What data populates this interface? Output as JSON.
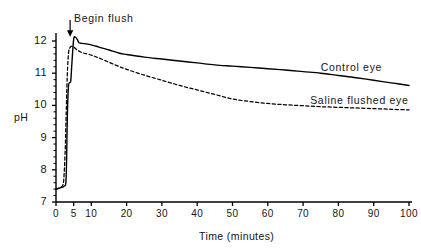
{
  "chart_data": {
    "type": "line",
    "title": "",
    "subtitle": "",
    "xlabel": "Time (minutes)",
    "ylabel": "pH",
    "xlim": [
      0,
      100
    ],
    "ylim": [
      7,
      12.3
    ],
    "grid": false,
    "legend_position": "inline-right",
    "xticks": [
      {
        "value": 0,
        "label": "0"
      },
      {
        "value": 5,
        "label": "5"
      },
      {
        "value": 10,
        "label": "10"
      },
      {
        "value": 20,
        "label": "20"
      },
      {
        "value": 30,
        "label": "30"
      },
      {
        "value": 40,
        "label": "40"
      },
      {
        "value": 50,
        "label": "50"
      },
      {
        "value": 60,
        "label": "60"
      },
      {
        "value": 70,
        "label": "70"
      },
      {
        "value": 80,
        "label": "80"
      },
      {
        "value": 90,
        "label": "90"
      },
      {
        "value": 100,
        "label": "100"
      }
    ],
    "yticks": [
      {
        "value": 7,
        "label": "7"
      },
      {
        "value": 8,
        "label": "8"
      },
      {
        "value": 9,
        "label": "9"
      },
      {
        "value": 10,
        "label": "10"
      },
      {
        "value": 11,
        "label": "11"
      },
      {
        "value": 12,
        "label": "12"
      }
    ],
    "annotations": [
      {
        "name": "begin-flush",
        "text": "Begin flush",
        "x": 4,
        "y": 12.3,
        "arrow": "down"
      }
    ],
    "series": [
      {
        "name": "Control eye",
        "label": "Control eye",
        "style": "solid",
        "color": "#000000",
        "label_x": 75,
        "label_y": 11.15,
        "x": [
          0.0,
          0.6,
          1.2,
          1.8,
          2.4,
          2.8,
          3.0,
          3.2,
          3.5,
          3.8,
          4.0,
          4.2,
          4.5,
          5.0,
          5.5,
          6.0,
          6.5,
          7.0,
          8.0,
          10.0,
          12.0,
          15.0,
          18.0,
          20.0,
          25.0,
          30.0,
          35.0,
          40.0,
          45.0,
          50.0,
          55.0,
          60.0,
          65.0,
          70.0,
          75.0,
          80.0,
          85.0,
          90.0,
          95.0,
          100.0
        ],
        "y": [
          7.4,
          7.42,
          7.44,
          7.46,
          7.5,
          7.6,
          8.3,
          9.6,
          10.55,
          10.7,
          10.72,
          10.78,
          11.3,
          12.05,
          12.12,
          12.05,
          11.95,
          11.93,
          11.92,
          11.88,
          11.82,
          11.72,
          11.62,
          11.58,
          11.5,
          11.44,
          11.38,
          11.32,
          11.26,
          11.22,
          11.18,
          11.14,
          11.1,
          11.05,
          11.0,
          10.93,
          10.86,
          10.78,
          10.7,
          10.62
        ]
      },
      {
        "name": "Saline flushed eye",
        "label": "Saline flushed eye",
        "style": "dashed",
        "color": "#000000",
        "label_x": 72,
        "label_y": 10.15,
        "x": [
          0.0,
          0.6,
          1.2,
          1.8,
          2.2,
          2.6,
          2.9,
          3.1,
          3.3,
          3.6,
          4.0,
          4.5,
          5.0,
          6.0,
          7.0,
          8.0,
          10.0,
          12.0,
          15.0,
          18.0,
          20.0,
          25.0,
          30.0,
          35.0,
          40.0,
          45.0,
          50.0,
          55.0,
          60.0,
          65.0,
          70.0,
          75.0,
          80.0,
          85.0,
          90.0,
          95.0,
          100.0
        ],
        "y": [
          7.4,
          7.42,
          7.45,
          7.5,
          7.7,
          8.6,
          9.8,
          10.6,
          11.2,
          11.68,
          11.8,
          11.84,
          11.82,
          11.72,
          11.66,
          11.62,
          11.56,
          11.48,
          11.34,
          11.2,
          11.12,
          10.94,
          10.78,
          10.62,
          10.48,
          10.34,
          10.2,
          10.12,
          10.06,
          10.02,
          9.99,
          9.96,
          9.94,
          9.92,
          9.9,
          9.88,
          9.86
        ]
      }
    ]
  },
  "axes": {
    "y_title": "pH",
    "x_title": "Time (minutes)"
  }
}
